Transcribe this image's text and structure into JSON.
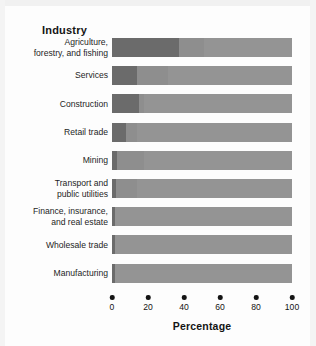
{
  "chart_data": {
    "type": "bar",
    "orientation": "horizontal",
    "stacked": true,
    "title": "Industry",
    "xlabel": "Percentage",
    "ylabel": "",
    "xlim": [
      0,
      100
    ],
    "xticks": [
      0,
      20,
      40,
      60,
      80,
      100
    ],
    "xtick_labels": [
      "0",
      "20",
      "40",
      "60",
      "80",
      "100"
    ],
    "grid": false,
    "legend": "none",
    "categories": [
      "Agriculture,\nforestry, and fishing",
      "Services",
      "Construction",
      "Retail trade",
      "Mining",
      "Transport and\npublic utilities",
      "Finance, insurance,\nand real estate",
      "Wholesale trade",
      "Manufacturing"
    ],
    "series": [
      {
        "name": "segment-1",
        "color": "#6b6b6b",
        "values": [
          37,
          14,
          15,
          8,
          3,
          2,
          1.5,
          1.5,
          1.5
        ]
      },
      {
        "name": "segment-2",
        "color": "#8e8e8e",
        "values": [
          14,
          17,
          3,
          6,
          15,
          12,
          0,
          0,
          0
        ]
      },
      {
        "name": "segment-3",
        "color": "#949494",
        "values": [
          49,
          69,
          82,
          86,
          82,
          86,
          98.5,
          98.5,
          98.5
        ]
      }
    ],
    "colors": {
      "segment_dark": "#6b6b6b",
      "segment_mid": "#8e8e8e",
      "segment_light": "#949494",
      "text": "#141414",
      "background": "#fdfdfd"
    }
  },
  "caption": ""
}
